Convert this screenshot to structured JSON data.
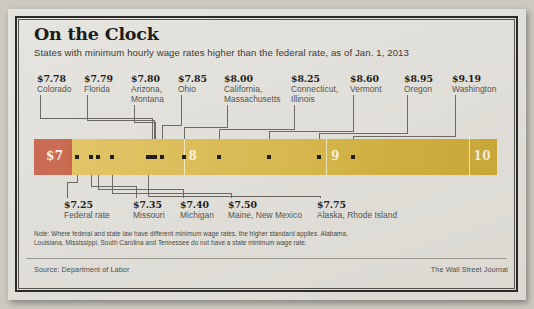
{
  "headline": "On the Clock",
  "subhead": "States with minimum hourly wage rates higher than the federal rate, as of Jan. 1, 2013",
  "note": "Note: Where federal and state law have different minimum wage rates, the higher standard applies. Alabama, Louisiana, Mississippi, South Carolina and Tennessee do not have a state minimum wage rate.",
  "source": "Source: Department of Labor",
  "brand": "The Wall Street Journal",
  "colors": {
    "federal_segment": "#c96b54",
    "bar_start": "#e3c86a",
    "bar_end": "#c8a637",
    "dot": "#211f1d",
    "leader": "#6d6a64",
    "paper": "#e6e4de"
  },
  "chart_data": {
    "type": "bar",
    "title": "On the Clock",
    "subtitle": "States with minimum hourly wage rates higher than the federal rate, as of Jan. 1, 2013",
    "xlabel": "Hourly minimum wage (dollars)",
    "ylabel": "",
    "xlim": [
      6.95,
      10.2
    ],
    "axis_ticks": [
      "$7",
      "8",
      "9",
      "10"
    ],
    "axis_tick_values": [
      7,
      8,
      9,
      10
    ],
    "grid": false,
    "legend": "none",
    "orientation": "horizontal-number-line",
    "categories": [
      "Federal rate",
      "Missouri",
      "Michigan",
      "Maine, New Mexico",
      "Alaska, Rhode Island",
      "Colorado",
      "Florida",
      "Arizona, Montana",
      "Ohio",
      "California, Massachusetts",
      "Connecticut, Illinois",
      "Vermont",
      "Oregon",
      "Washington"
    ],
    "values": [
      7.25,
      7.35,
      7.4,
      7.5,
      7.75,
      7.78,
      7.79,
      7.8,
      7.85,
      8.0,
      8.25,
      8.6,
      8.95,
      9.19
    ],
    "points_above": [
      {
        "amount": "$7.78",
        "names": [
          "Colorado"
        ],
        "value": 7.78
      },
      {
        "amount": "$7.79",
        "names": [
          "Florida"
        ],
        "value": 7.79
      },
      {
        "amount": "$7.80",
        "names": [
          "Arizona,",
          "Montana"
        ],
        "value": 7.8
      },
      {
        "amount": "$7.85",
        "names": [
          "Ohio"
        ],
        "value": 7.85
      },
      {
        "amount": "$8.00",
        "names": [
          "California,",
          "Massachusetts"
        ],
        "value": 8.0
      },
      {
        "amount": "$8.25",
        "names": [
          "Connecticut,",
          "Illinois"
        ],
        "value": 8.25
      },
      {
        "amount": "$8.60",
        "names": [
          "Vermont"
        ],
        "value": 8.6
      },
      {
        "amount": "$8.95",
        "names": [
          "Oregon"
        ],
        "value": 8.95
      },
      {
        "amount": "$9.19",
        "names": [
          "Washington"
        ],
        "value": 9.19
      }
    ],
    "points_below": [
      {
        "amount": "$7.25",
        "names": [
          "Federal rate"
        ],
        "value": 7.25
      },
      {
        "amount": "$7.35",
        "names": [
          "Missouri"
        ],
        "value": 7.35
      },
      {
        "amount": "$7.40",
        "names": [
          "Michigan"
        ],
        "value": 7.4
      },
      {
        "amount": "$7.50",
        "names": [
          "Maine, New Mexico"
        ],
        "value": 7.5
      },
      {
        "amount": "$7.75",
        "names": [
          "Alaska, Rhode Island"
        ],
        "value": 7.75
      }
    ]
  }
}
